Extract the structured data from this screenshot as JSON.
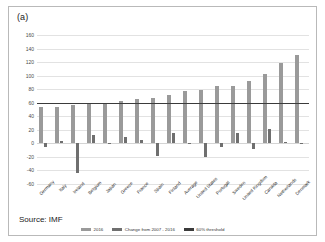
{
  "figure": {
    "panel_label": "(a)",
    "source": "Source: IMF"
  },
  "legend": {
    "items": [
      {
        "label": "2016",
        "key": "level",
        "color": "#9a9a9a"
      },
      {
        "label": "Change from 2007 - 2016",
        "key": "change",
        "color": "#6f6f6f"
      },
      {
        "label": "60% threshold",
        "key": "threshold",
        "color": "#3b3b3b"
      }
    ]
  },
  "chart_data": {
    "type": "bar",
    "title": "(a)",
    "xlabel": "",
    "ylabel": "",
    "ylim": [
      -60,
      160
    ],
    "yticks": [
      160,
      140,
      120,
      100,
      80,
      60,
      40,
      20,
      0,
      -20,
      -40,
      -60
    ],
    "ytick_labels": [
      "160",
      "140",
      "120",
      "100",
      "80",
      "60",
      "40",
      "20",
      "0",
      "-20",
      "-40",
      "-60"
    ],
    "grid": true,
    "legend_position": "bottom",
    "threshold": 60,
    "threshold_label": "60% threshold",
    "categories": [
      "Germany",
      "Italy",
      "Ireland",
      "Belgium",
      "Japan",
      "Greece",
      "France",
      "Spain",
      "Finland",
      "Average",
      "United States",
      "Portugal",
      "Sweden",
      "United Kingdom",
      "Canada",
      "Netherlands",
      "Denmark"
    ],
    "series": [
      {
        "name": "2016",
        "color": "#9a9a9a",
        "values": [
          53,
          54,
          56,
          60,
          60,
          63,
          65,
          67,
          71,
          77,
          79,
          85,
          85,
          92,
          102,
          118,
          131
        ]
      },
      {
        "name": "Change from 2007 - 2016",
        "color": "#6f6f6f",
        "values": [
          -5,
          3,
          -44,
          13,
          1,
          10,
          5,
          -19,
          16,
          1,
          -20,
          -6,
          15,
          -8,
          21,
          2,
          0
        ]
      }
    ]
  }
}
